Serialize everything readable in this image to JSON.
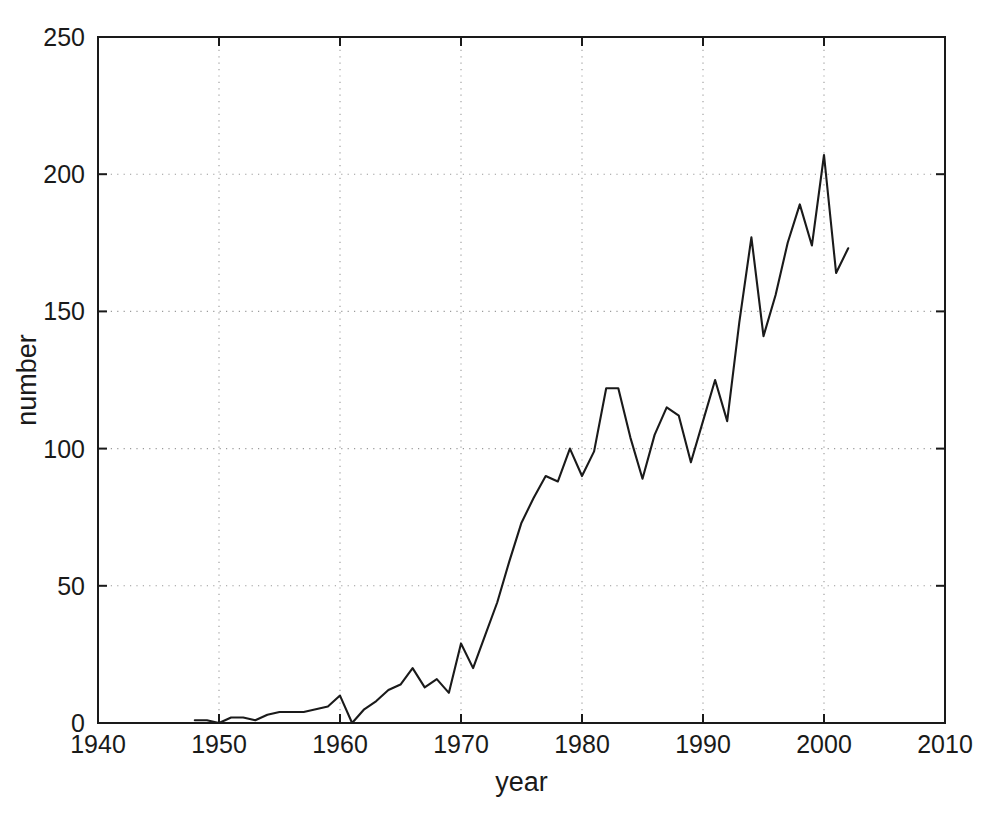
{
  "figure": {
    "background_color": "#ffffff",
    "line_color": "#1a1a1a",
    "grid_color": "#9a9a9a",
    "axis_color": "#1a1a1a"
  },
  "axes": {
    "x_title": "year",
    "y_title": "number",
    "x_ticks": [
      "1940",
      "1950",
      "1960",
      "1970",
      "1980",
      "1990",
      "2000",
      "2010"
    ],
    "y_ticks": [
      "0",
      "50",
      "100",
      "150",
      "200",
      "250"
    ]
  },
  "chart_data": {
    "type": "line",
    "title": "",
    "xlabel": "year",
    "ylabel": "number",
    "xlim": [
      1940,
      2010
    ],
    "ylim": [
      0,
      250
    ],
    "xticks": [
      1940,
      1950,
      1960,
      1970,
      1980,
      1990,
      2000,
      2010
    ],
    "yticks": [
      0,
      50,
      100,
      150,
      200,
      250
    ],
    "grid": true,
    "grid_style": "dotted",
    "legend": null,
    "series": [
      {
        "name": "number",
        "x": [
          1948,
          1949,
          1950,
          1951,
          1952,
          1953,
          1954,
          1955,
          1956,
          1957,
          1958,
          1959,
          1960,
          1961,
          1962,
          1963,
          1964,
          1965,
          1966,
          1967,
          1968,
          1969,
          1970,
          1971,
          1972,
          1973,
          1974,
          1975,
          1976,
          1977,
          1978,
          1979,
          1980,
          1981,
          1982,
          1983,
          1984,
          1985,
          1986,
          1987,
          1988,
          1989,
          1990,
          1991,
          1992,
          1993,
          1994,
          1995,
          1996,
          1997,
          1998,
          1999,
          2000,
          2001,
          2002
        ],
        "y": [
          1,
          1,
          0,
          2,
          2,
          1,
          3,
          4,
          4,
          4,
          5,
          6,
          10,
          0,
          5,
          8,
          12,
          14,
          20,
          13,
          16,
          11,
          29,
          20,
          32,
          44,
          59,
          73,
          82,
          90,
          88,
          100,
          90,
          99,
          122,
          122,
          104,
          89,
          105,
          115,
          112,
          95,
          110,
          125,
          110,
          146,
          177,
          141,
          156,
          175,
          189,
          174,
          207,
          164,
          173
        ]
      }
    ]
  }
}
